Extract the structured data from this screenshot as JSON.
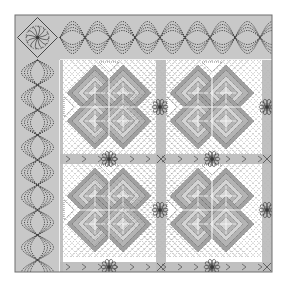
{
  "quilt": {
    "title": "Celtic knot quilt with cable border",
    "colors": {
      "background": "#ffffff",
      "border_fill": "#c8c8c8",
      "border_edge": "#6e6e6e",
      "sash_fill": "#b9b9b9",
      "block_white": "#ffffff",
      "knot_light": "#d4d4d4",
      "knot_mid": "#b4b4b4",
      "knot_dark": "#a0a0a0",
      "stitch": "#3a3a3a",
      "highlight": "#ffffff"
    },
    "bounds": {
      "x": 15,
      "y": 15,
      "right": 272,
      "bottom": 272
    },
    "border": {
      "width": 45
    },
    "corner_motif": {
      "icon": "flower-in-diamond-icon",
      "petals": 12
    },
    "cable": {
      "strands": 4,
      "repeat": 50
    },
    "blocks": {
      "rows": 2,
      "cols": 2,
      "origin": [
        60,
        60
      ],
      "size": 94,
      "sash": 9
    }
  }
}
